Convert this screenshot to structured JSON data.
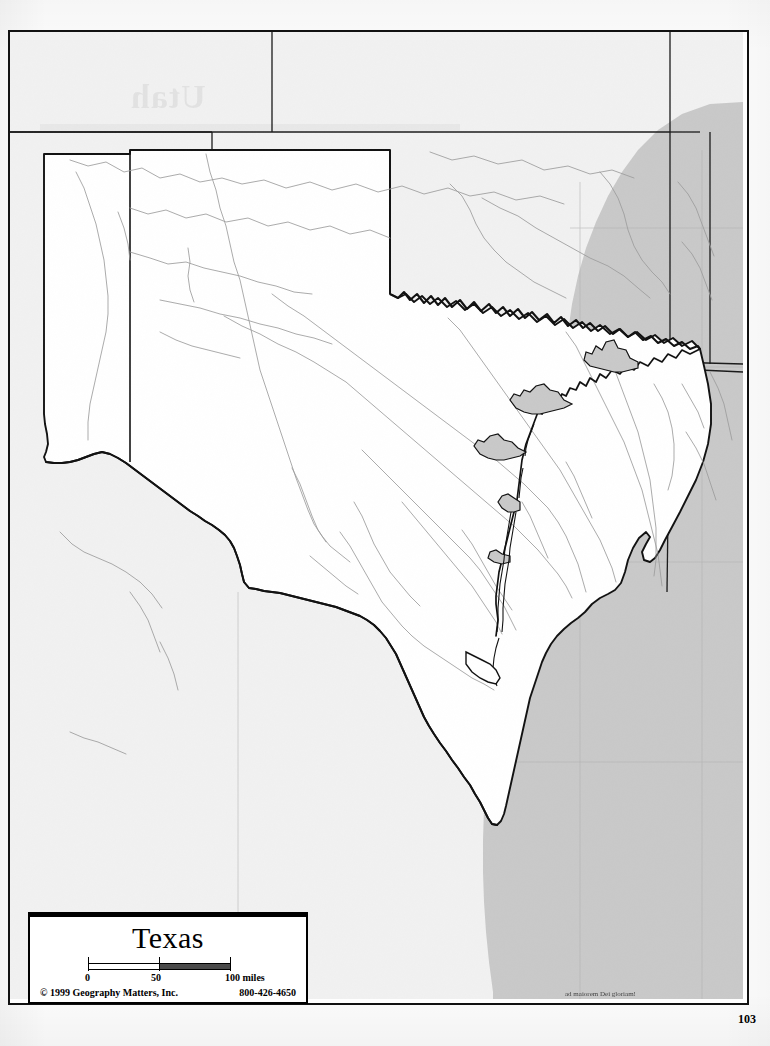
{
  "page": {
    "number": "103",
    "motto": "ad maiorem Dei gloriam!",
    "ghost_text": "Utah"
  },
  "title_block": {
    "title": "Texas",
    "copyright": "© 1999 Geography Matters, Inc.",
    "phone": "800-426-4650"
  },
  "scale": {
    "label_0": "0",
    "label_50": "50",
    "label_100": "100 miles",
    "units": "miles",
    "max_value": 100
  },
  "map": {
    "subject_state": "Texas",
    "water_body": "Gulf of Mexico",
    "colors": {
      "subject_fill": "#ffffff",
      "neighbor_fill": "#f1f1f1",
      "water_fill": "#c9c9c9",
      "border_stroke": "#111111",
      "river_stroke": "#9a9a9a",
      "grid_stroke": "#b4b4b4"
    },
    "neighbor_states": [
      "New Mexico",
      "Oklahoma",
      "Arkansas",
      "Louisiana",
      "Mexico"
    ],
    "features": [
      "state-outline",
      "rivers",
      "coastline",
      "barrier-islands",
      "latitude-longitude-grid"
    ]
  },
  "geometry": {
    "texas_outline": "M 210,148 L 385,148 L 385,300 L 392,303 L 400,299 L 409,305 L 418,300 L 427,308 L 436,303 L 446,311 L 455,306 L 466,313 L 475,308 L 486,316 L 494,311 L 503,319 L 512,314 L 521,322 L 531,317 L 540,326 L 549,322 L 558,330 L 567,325 L 575,333 L 584,329 L 593,337 L 602,332 L 612,340 L 621,336 L 630,343 L 640,339 L 650,346 L 660,342 L 670,349 L 680,345 L 690,351 L 699,348 L 708,356 L 713,372 L 716,392 L 720,414 L 719,438 L 716,460 L 710,480 L 702,498 L 694,516 L 686,534 L 678,551 L 672,566 L 668,578 L 662,588 L 657,596 L 650,596 L 646,588 L 648,578 L 652,570 L 648,566 L 641,572 L 636,582 L 632,594 L 630,606 L 627,616 L 621,622 L 614,626 L 606,631 L 598,638 L 592,646 L 585,652 L 578,656 L 571,661 L 564,668 L 558,676 L 553,684 L 549,692 L 546,700 L 543,708 L 540,716 L 537,724 L 535,733 L 533,742 L 531,751 L 529,760 L 527,769 L 525,778 L 523,787 L 521,796 L 519,805 L 517,814 L 515,822 L 512,828 L 507,832 L 502,830 L 498,824 L 494,816 L 489,808 L 484,800 L 478,792 L 472,784 L 466,776 L 460,768 L 454,760 L 448,752 L 443,744 L 438,736 L 434,727 L 430,718 L 426,709 L 422,700 L 418,691 L 414,682 L 410,673 L 406,664 L 402,656 L 397,648 L 392,641 L 386,634 L 380,628 L 373,623 L 366,619 L 358,616 L 350,613 L 342,610 L 334,607 L 326,604 L 318,602 L 310,600 L 302,598 L 294,596 L 286,594 L 278,592 L 270,590 L 262,589 L 254,588 L 247,586 L 243,580 L 241,572 L 239,563 L 237,554 L 234,546 L 230,539 L 225,533 L 219,528 L 212,524 L 205,520 L 198,516 L 190,511 L 182,506 L 174,500 L 166,494 L 158,488 L 150,482 L 142,476 L 134,470 L 126,464 L 118,458 L 110,453 L 102,449 L 94,447 L 86,449 L 78,452 L 70,455 L 62,457 L 54,458 L 46,458 L 40,457 L 40,452 L 44,448 L 46,440 L 45,430 L 43,420 L 42,410 L 42,400 L 42,390 L 42,380 L 42,370 L 42,360 L 42,350 L 42,340 L 42,330 L 42,320 L 42,310 L 42,300 L 42,290 L 42,280 L 42,270 L 42,260 L 42,250 L 42,240 L 42,230 L 42,220 L 42,210 L 42,200 L 42,190 L 42,180 L 42,170 L 42,160 L 42,150 Z"
  }
}
